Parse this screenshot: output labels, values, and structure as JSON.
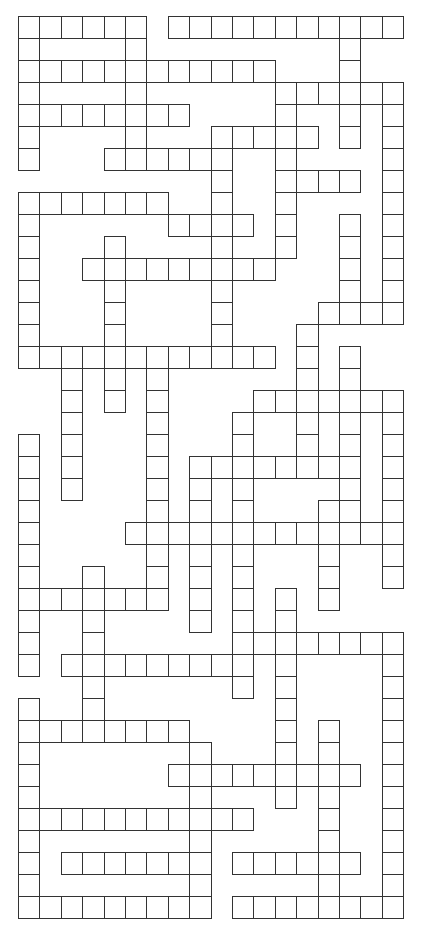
{
  "puzzle": {
    "type": "crossword-grid",
    "cols": 18,
    "rows": 41,
    "cell_width": 21.4,
    "cell_height": 22.0,
    "origin": [
      18,
      16
    ],
    "colors": {
      "line": "#333333",
      "cell_fill": "#ffffff",
      "background": "#ffffff"
    },
    "filled_cells_by_row": [
      [
        [
          0,
          5
        ],
        [
          7,
          17
        ]
      ],
      [
        [
          0,
          0
        ],
        [
          5,
          5
        ],
        [
          15,
          15
        ]
      ],
      [
        [
          0,
          11
        ],
        [
          15,
          15
        ]
      ],
      [
        [
          0,
          0
        ],
        [
          5,
          5
        ],
        [
          12,
          17
        ]
      ],
      [
        [
          0,
          7
        ],
        [
          12,
          12
        ],
        [
          15,
          15
        ],
        [
          17,
          17
        ]
      ],
      [
        [
          0,
          0
        ],
        [
          5,
          5
        ],
        [
          9,
          13
        ],
        [
          15,
          15
        ],
        [
          17,
          17
        ]
      ],
      [
        [
          0,
          0
        ],
        [
          4,
          9
        ],
        [
          12,
          12
        ],
        [
          17,
          17
        ]
      ],
      [
        [
          9,
          9
        ],
        [
          12,
          15
        ],
        [
          17,
          17
        ]
      ],
      [
        [
          0,
          6
        ],
        [
          9,
          9
        ],
        [
          12,
          12
        ],
        [
          17,
          17
        ]
      ],
      [
        [
          0,
          0
        ],
        [
          7,
          10
        ],
        [
          12,
          12
        ],
        [
          15,
          15
        ],
        [
          17,
          17
        ]
      ],
      [
        [
          0,
          0
        ],
        [
          4,
          4
        ],
        [
          9,
          9
        ],
        [
          12,
          12
        ],
        [
          15,
          15
        ],
        [
          17,
          17
        ]
      ],
      [
        [
          0,
          0
        ],
        [
          3,
          11
        ],
        [
          15,
          15
        ],
        [
          17,
          17
        ]
      ],
      [
        [
          0,
          0
        ],
        [
          4,
          4
        ],
        [
          9,
          9
        ],
        [
          15,
          15
        ],
        [
          17,
          17
        ]
      ],
      [
        [
          0,
          0
        ],
        [
          4,
          4
        ],
        [
          9,
          9
        ],
        [
          14,
          17
        ]
      ],
      [
        [
          0,
          0
        ],
        [
          4,
          4
        ],
        [
          9,
          9
        ],
        [
          13,
          13
        ]
      ],
      [
        [
          0,
          11
        ],
        [
          13,
          13
        ],
        [
          15,
          15
        ]
      ],
      [
        [
          2,
          2
        ],
        [
          4,
          4
        ],
        [
          6,
          6
        ],
        [
          13,
          13
        ],
        [
          15,
          15
        ]
      ],
      [
        [
          2,
          2
        ],
        [
          4,
          4
        ],
        [
          6,
          6
        ],
        [
          11,
          17
        ]
      ],
      [
        [
          2,
          2
        ],
        [
          6,
          6
        ],
        [
          10,
          10
        ],
        [
          13,
          13
        ],
        [
          15,
          15
        ],
        [
          17,
          17
        ]
      ],
      [
        [
          0,
          0
        ],
        [
          2,
          2
        ],
        [
          6,
          6
        ],
        [
          10,
          10
        ],
        [
          13,
          13
        ],
        [
          15,
          15
        ],
        [
          17,
          17
        ]
      ],
      [
        [
          0,
          0
        ],
        [
          2,
          2
        ],
        [
          6,
          6
        ],
        [
          8,
          15
        ],
        [
          17,
          17
        ]
      ],
      [
        [
          0,
          0
        ],
        [
          2,
          2
        ],
        [
          6,
          6
        ],
        [
          8,
          8
        ],
        [
          10,
          10
        ],
        [
          15,
          15
        ],
        [
          17,
          17
        ]
      ],
      [
        [
          0,
          0
        ],
        [
          6,
          6
        ],
        [
          8,
          8
        ],
        [
          10,
          10
        ],
        [
          14,
          15
        ],
        [
          17,
          17
        ]
      ],
      [
        [
          0,
          0
        ],
        [
          5,
          17
        ]
      ],
      [
        [
          0,
          0
        ],
        [
          6,
          6
        ],
        [
          8,
          8
        ],
        [
          10,
          10
        ],
        [
          14,
          14
        ],
        [
          17,
          17
        ]
      ],
      [
        [
          0,
          0
        ],
        [
          3,
          3
        ],
        [
          6,
          6
        ],
        [
          8,
          8
        ],
        [
          10,
          10
        ],
        [
          14,
          14
        ],
        [
          17,
          17
        ]
      ],
      [
        [
          0,
          6
        ],
        [
          8,
          8
        ],
        [
          10,
          10
        ],
        [
          12,
          12
        ],
        [
          14,
          14
        ]
      ],
      [
        [
          0,
          0
        ],
        [
          3,
          3
        ],
        [
          8,
          8
        ],
        [
          10,
          10
        ],
        [
          12,
          12
        ]
      ],
      [
        [
          0,
          0
        ],
        [
          3,
          3
        ],
        [
          10,
          17
        ]
      ],
      [
        [
          0,
          0
        ],
        [
          2,
          10
        ],
        [
          12,
          12
        ],
        [
          17,
          17
        ]
      ],
      [
        [
          3,
          3
        ],
        [
          10,
          10
        ],
        [
          12,
          12
        ],
        [
          17,
          17
        ]
      ],
      [
        [
          0,
          0
        ],
        [
          3,
          3
        ],
        [
          12,
          12
        ],
        [
          17,
          17
        ]
      ],
      [
        [
          0,
          7
        ],
        [
          12,
          12
        ],
        [
          14,
          14
        ],
        [
          17,
          17
        ]
      ],
      [
        [
          0,
          0
        ],
        [
          8,
          8
        ],
        [
          12,
          12
        ],
        [
          14,
          14
        ],
        [
          17,
          17
        ]
      ],
      [
        [
          0,
          0
        ],
        [
          7,
          15
        ],
        [
          17,
          17
        ]
      ],
      [
        [
          0,
          0
        ],
        [
          8,
          8
        ],
        [
          12,
          12
        ],
        [
          14,
          14
        ],
        [
          17,
          17
        ]
      ],
      [
        [
          0,
          10
        ],
        [
          14,
          14
        ],
        [
          17,
          17
        ]
      ],
      [
        [
          0,
          0
        ],
        [
          8,
          8
        ],
        [
          14,
          14
        ],
        [
          17,
          17
        ]
      ],
      [
        [
          0,
          0
        ],
        [
          2,
          8
        ],
        [
          10,
          15
        ],
        [
          17,
          17
        ]
      ],
      [
        [
          0,
          0
        ],
        [
          8,
          8
        ],
        [
          14,
          14
        ],
        [
          17,
          17
        ]
      ],
      [
        [
          0,
          8
        ],
        [
          10,
          17
        ]
      ]
    ]
  }
}
